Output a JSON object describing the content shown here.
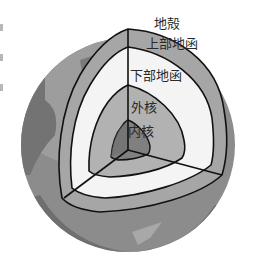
{
  "diagram": {
    "labels": {
      "crust": "地殻",
      "upper_mantle": "上部地函",
      "lower_mantle": "下部地函",
      "outer_core": "外核",
      "inner_core": "内核"
    },
    "colors": {
      "background": "#ffffff",
      "surface_light": "#9a9a9a",
      "surface_dark": "#6e6e6e",
      "surface_patch": "#8a8a8a",
      "crust_band": "#a6a6a6",
      "upper_mantle": "#f4f4f4",
      "outer_core": "#b2b2b2",
      "inner_core": "#808080",
      "outline": "#111111",
      "label_text": "#2a2a2a"
    }
  }
}
